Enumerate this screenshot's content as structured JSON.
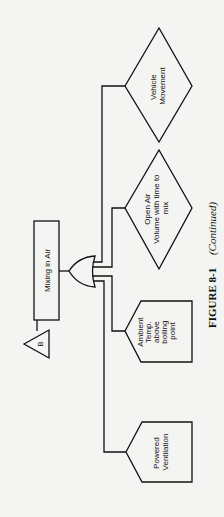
{
  "diagram": {
    "type": "fault-tree",
    "orientation": "rotated-90-ccw",
    "top_event": {
      "label": "Mixing in Air",
      "shape": "rectangle"
    },
    "transfer": {
      "label": "B",
      "shape": "triangle"
    },
    "gate": {
      "type": "OR"
    },
    "inputs": [
      {
        "label_lines": [
          "Powered",
          "Ventilation"
        ],
        "shape": "house"
      },
      {
        "label_lines": [
          "Ambient",
          "Temp.",
          "above",
          "boiling",
          "point"
        ],
        "shape": "house"
      },
      {
        "label_lines": [
          "Open Air",
          "Volume with time to",
          "mix"
        ],
        "shape": "diamond"
      },
      {
        "label_lines": [
          "Vehicle",
          "Movement"
        ],
        "shape": "diamond"
      }
    ]
  },
  "caption": {
    "figure": "FIGURE 8-1",
    "note": "(Continued)"
  }
}
